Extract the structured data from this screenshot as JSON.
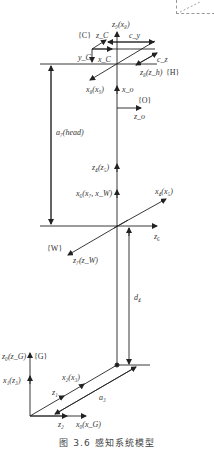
{
  "figure": {
    "caption": "图 3.6  感知系统模型",
    "type": "coordinate-frame kinematic diagram"
  },
  "frames": {
    "C": "{C}",
    "H": "{H}",
    "O": "{O}",
    "W": "{W}",
    "G": "{G}"
  },
  "labels": {
    "z9_x8": "z₉(x₈)",
    "zC": "z_C",
    "cy": "c_y",
    "yC": "y_C",
    "xC": "x_C",
    "cz": "c_z",
    "z8_zh": "z₈(z_h)",
    "x8_x9": "x₈(x₉)",
    "xo": "x_o",
    "zo": "z_o",
    "a7_head": "a₇(head)",
    "z4_z5": "z₄(z₅)",
    "x6_x7_xW": "x₆(x₇, x_W)",
    "x4_x5": "x₄(x₅)",
    "z6": "z₆",
    "z7_zW": "z₇(z_W)",
    "d4": "d₄",
    "z0_zG": "z₀(z_G)",
    "x1_z3": "x₁(z₃)",
    "x2_x3": "x₂(x₃)",
    "z1": "z₁",
    "a3": "a₃",
    "z2": "z₂",
    "x0_xG": "x₀(x_G)"
  },
  "colors": {
    "line": "#222222",
    "text": "#333333",
    "dashed": "#999999"
  }
}
